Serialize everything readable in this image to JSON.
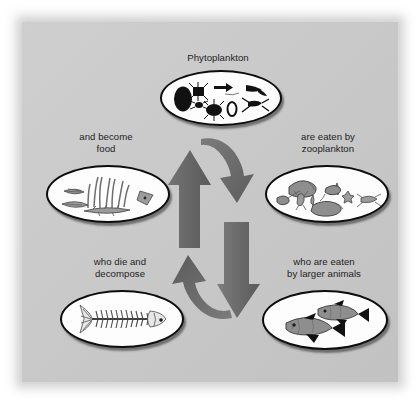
{
  "figure": {
    "kind": "marine-food-chain-cycle-diagram",
    "background_color": "#c8c8c8",
    "page_color": "#ffffff",
    "text_color": "#1d1d1d",
    "oval_fill": "#fdfdfd",
    "oval_border": "#0d0d0d",
    "arrow_color": "#6b6b6b"
  },
  "nodes": [
    {
      "id": "phytoplankton",
      "label": "Phytoplankton",
      "label_position": "above",
      "illustration": "phytoplankton-silhouettes",
      "illustration_description": "black silhouettes of diatoms and algae cells"
    },
    {
      "id": "zooplankton",
      "label": "are eaten by\nzooplankton",
      "label_position": "above",
      "illustration": "zooplankton-silhouettes",
      "illustration_description": "gray copepods, larvae and rotifers"
    },
    {
      "id": "larger-animals",
      "label": "who are eaten\nby larger animals",
      "label_position": "above",
      "illustration": "two-fish",
      "illustration_description": "two gray fish swimming"
    },
    {
      "id": "decompose",
      "label": "who die and\ndecompose",
      "label_position": "above",
      "illustration": "fish-skeleton",
      "illustration_description": "skeleton of a fish with ribs and tail"
    },
    {
      "id": "become-food",
      "label": "and become\nfood",
      "label_position": "above",
      "illustration": "seaweed-and-detritus",
      "illustration_description": "seaweed fronds with shell fragments and detritus"
    }
  ],
  "arrows": [
    {
      "id": "arrow-top-right",
      "from": "phytoplankton",
      "to": "zooplankton",
      "direction": "down-right",
      "color": "#6b6b6b"
    },
    {
      "id": "arrow-right-down",
      "from": "zooplankton",
      "to": "larger-animals",
      "direction": "down",
      "color": "#6b6b6b"
    },
    {
      "id": "arrow-bottom-left",
      "from": "larger-animals",
      "to": "decompose",
      "direction": "up-left",
      "color": "#6b6b6b"
    },
    {
      "id": "arrow-left-up",
      "from": "become-food",
      "to": "phytoplankton",
      "direction": "up",
      "color": "#6b6b6b"
    }
  ]
}
